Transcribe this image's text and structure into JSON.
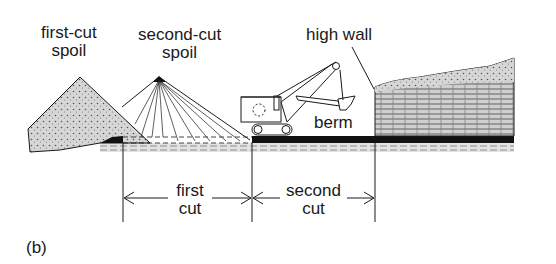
{
  "figure": {
    "panel_label": "(b)",
    "labels": {
      "first_cut_spoil": [
        "first-cut",
        "spoil"
      ],
      "second_cut_spoil": [
        "second-cut",
        "spoil"
      ],
      "high_wall": "high wall",
      "berm": "berm",
      "first_cut": [
        "first",
        "cut"
      ],
      "second_cut": [
        "second",
        "cut"
      ]
    },
    "elements": [
      "first-cut spoil pile",
      "second-cut spoil pile (with dump rays)",
      "power shovel / dragline excavator",
      "coal seam",
      "overburden with high wall",
      "dimension arrows for first and second cut"
    ],
    "colors": {
      "ink": "#1a1a1a",
      "spoil_fill": "#d4d4d4",
      "overburden_fill": "#cfcfcf",
      "coal": "#111111"
    }
  }
}
